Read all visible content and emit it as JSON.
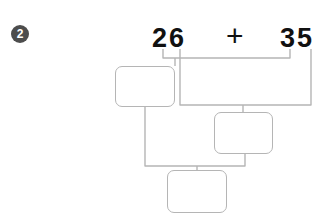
{
  "worksheet": {
    "problem_number": "2",
    "equation": {
      "addend_one": "26",
      "operator": "+",
      "addend_two": "35"
    },
    "answer_boxes": [
      {
        "name": "tens-partial-sum",
        "value": ""
      },
      {
        "name": "ones-partial-sum",
        "value": ""
      },
      {
        "name": "total-sum",
        "value": ""
      }
    ],
    "colors": {
      "badge_fill": "#4d4d4d",
      "badge_text": "#ffffff",
      "digit_text": "#111111",
      "line": "#b5b5b5",
      "box_fill": "#ffffff",
      "background": "#ffffff"
    }
  }
}
